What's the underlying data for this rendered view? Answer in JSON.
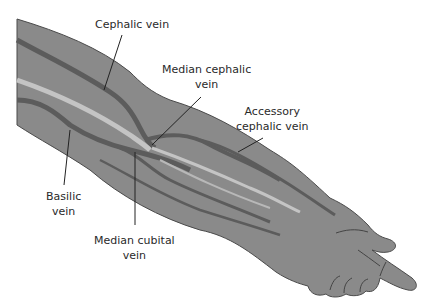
{
  "diagram": {
    "colors": {
      "skin": "#8a8a8a",
      "outline": "#4a4a4a",
      "vein": "#5c5c5c",
      "highlight": "#c4c4c4",
      "leader_line": "#222222",
      "text": "#2a2a2a"
    },
    "labels": [
      {
        "id": "cephalic",
        "line1": "Cephalic vein",
        "line2": ""
      },
      {
        "id": "median-cephalic",
        "line1": "Median cephalic",
        "line2": "vein"
      },
      {
        "id": "accessory-cephalic",
        "line1": "Accessory",
        "line2": "cephalic vein"
      },
      {
        "id": "basilic",
        "line1": "Basilic",
        "line2": "vein"
      },
      {
        "id": "median-cubital",
        "line1": "Median cubital",
        "line2": "vein"
      }
    ]
  }
}
